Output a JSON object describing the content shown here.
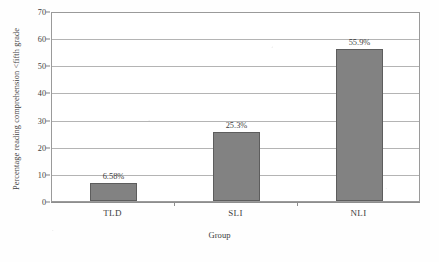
{
  "chart_data": {
    "type": "bar",
    "title": "",
    "subtitle": "",
    "categories": [
      "TLD",
      "SLI",
      "NLI"
    ],
    "values": [
      6.58,
      25.3,
      55.9
    ],
    "data_labels": [
      "6.58%",
      "25.3%",
      "55.9%"
    ],
    "xlabel": "Group",
    "ylabel": "Percentage reading comprehension <fifth grade",
    "ylim": [
      0,
      70
    ],
    "yticks": [
      0,
      10,
      20,
      30,
      40,
      50,
      60,
      70
    ],
    "ytick_labels": [
      "0",
      "10",
      "20",
      "30",
      "40",
      "50",
      "60",
      "70"
    ],
    "grid": true,
    "grid_axis": "y",
    "legend": false,
    "legend_position": "none",
    "series": [
      {
        "name": "Percentage reading comprehension <fifth grade",
        "values": [
          6.58,
          25.3,
          55.9
        ]
      }
    ],
    "colors": {
      "bar_fill": "#828282",
      "bar_edge": "#5d5d5d",
      "plot_background": "#ffffff",
      "figure_background": "#fefefe",
      "gridline": "#b4b4b4",
      "axis": "#8d8d8d",
      "text": "#3d3d3d"
    }
  }
}
